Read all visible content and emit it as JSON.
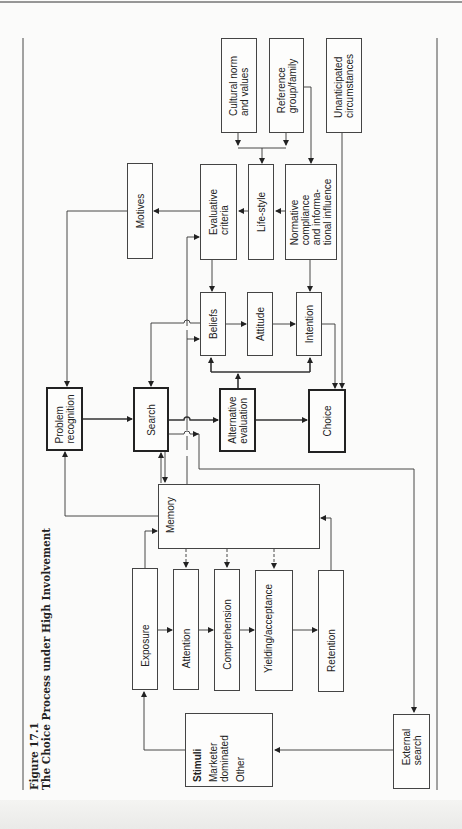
{
  "figure": {
    "number": "Figure 17.1",
    "title": "The Choice Process under High Involvement"
  },
  "nodes": {
    "cultural": {
      "lines": [
        "Cultural norm",
        "and values"
      ]
    },
    "reference": {
      "lines": [
        "Reference",
        "group/family"
      ]
    },
    "unanticipated": {
      "lines": [
        "Unanticipated",
        "circumstances"
      ]
    },
    "motives": {
      "lines": [
        "Motives"
      ]
    },
    "evaluative": {
      "lines": [
        "Evaluative",
        "criteria"
      ]
    },
    "lifestyle": {
      "lines": [
        "Life-style"
      ]
    },
    "normative": {
      "lines": [
        "Normative",
        "compliance",
        "and informa-",
        "tional influence"
      ]
    },
    "beliefs": {
      "lines": [
        "Beliefs"
      ]
    },
    "attitude": {
      "lines": [
        "Attitude"
      ]
    },
    "intention": {
      "lines": [
        "Intention"
      ]
    },
    "problem": {
      "lines": [
        "Problem",
        "recognition"
      ]
    },
    "search": {
      "lines": [
        "Search"
      ]
    },
    "alternative": {
      "lines": [
        "Alternative",
        "evaluation"
      ]
    },
    "choice": {
      "lines": [
        "Choice"
      ]
    },
    "memory": {
      "lines": [
        "Memory"
      ]
    },
    "exposure": {
      "lines": [
        "Exposure"
      ]
    },
    "attention": {
      "lines": [
        "Attention"
      ]
    },
    "comprehension": {
      "lines": [
        "Comprehension"
      ]
    },
    "yielding": {
      "lines": [
        "Yielding/acceptance"
      ]
    },
    "retention": {
      "lines": [
        "Retention"
      ]
    },
    "stimuli": {
      "heading": "Stimuli",
      "lines": [
        "Marketer",
        "dominated"
      ],
      "extra": "Other"
    },
    "external": {
      "lines": [
        "External",
        "search"
      ]
    }
  },
  "colors": {
    "line": "#333333",
    "background": "#fbfbfa"
  }
}
